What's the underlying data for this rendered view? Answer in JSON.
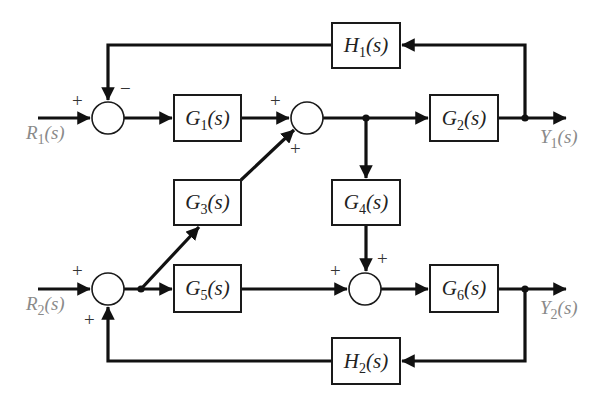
{
  "diagram": {
    "type": "block-diagram",
    "inputs": [
      {
        "id": "R1",
        "label_main": "R",
        "label_sub": "1",
        "label_arg": "(s)"
      },
      {
        "id": "R2",
        "label_main": "R",
        "label_sub": "2",
        "label_arg": "(s)"
      }
    ],
    "outputs": [
      {
        "id": "Y1",
        "label_main": "Y",
        "label_sub": "1",
        "label_arg": "(s)"
      },
      {
        "id": "Y2",
        "label_main": "Y",
        "label_sub": "2",
        "label_arg": "(s)"
      }
    ],
    "blocks": [
      {
        "id": "G1",
        "main": "G",
        "sub": "1",
        "arg": "(s)"
      },
      {
        "id": "G2",
        "main": "G",
        "sub": "2",
        "arg": "(s)"
      },
      {
        "id": "G3",
        "main": "G",
        "sub": "3",
        "arg": "(s)"
      },
      {
        "id": "G4",
        "main": "G",
        "sub": "4",
        "arg": "(s)"
      },
      {
        "id": "G5",
        "main": "G",
        "sub": "5",
        "arg": "(s)"
      },
      {
        "id": "G6",
        "main": "G",
        "sub": "6",
        "arg": "(s)"
      },
      {
        "id": "H1",
        "main": "H",
        "sub": "1",
        "arg": "(s)"
      },
      {
        "id": "H2",
        "main": "H",
        "sub": "2",
        "arg": "(s)"
      }
    ],
    "summing_junctions": [
      {
        "id": "S1",
        "signs": {
          "left": "+",
          "top": "−"
        }
      },
      {
        "id": "S2",
        "signs": {
          "left": "+",
          "bottom": "+"
        }
      },
      {
        "id": "S3",
        "signs": {
          "left": "+",
          "bottom": "+"
        }
      },
      {
        "id": "S4",
        "signs": {
          "left": "+",
          "top": "+"
        }
      }
    ],
    "connections": [
      "R1 -> S1(+)",
      "S1 -> G1",
      "G1 -> S2(+)",
      "G3 -> S2(+)",
      "S2 -> G2",
      "S2 -> G4",
      "G2 -> Y1",
      "Y1 -> H1",
      "H1 -> S1(−)",
      "R2 -> S3(+)",
      "S3 -> G5",
      "S3 -> G3",
      "G5 -> S4(+)",
      "G4 -> S4(+)",
      "S4 -> G6",
      "G6 -> Y2",
      "Y2 -> H2",
      "H2 -> S3(+)"
    ]
  }
}
